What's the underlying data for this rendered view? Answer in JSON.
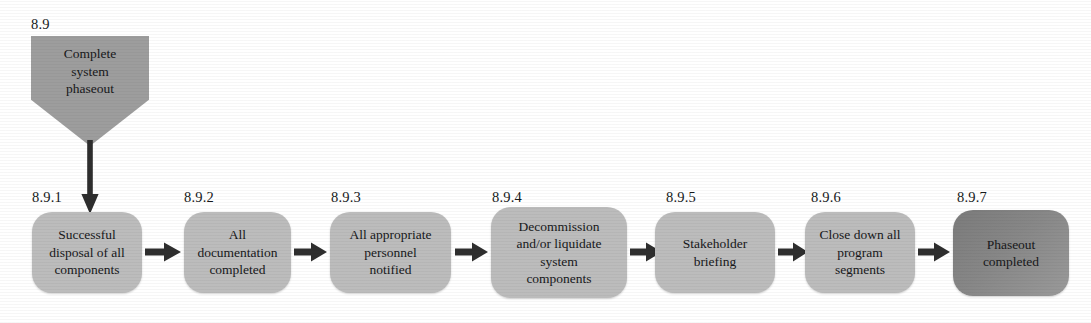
{
  "diagram": {
    "colors": {
      "start_node_fill": "#9d9d9d",
      "process_node_fill": "#bcbcbc",
      "final_node_fill": "#7f7f7f",
      "arrow": "#2e2e2e",
      "text": "#17181a",
      "background": "#ffffff"
    },
    "start_node": {
      "id": "8.9",
      "text": "Complete system phaseout",
      "lines": [
        "Complete",
        "system",
        "phaseout"
      ],
      "shape": "pentagon"
    },
    "steps": [
      {
        "id": "8.9.1",
        "text": "Successful disposal of all components",
        "lines": [
          "Successful",
          "disposal of all",
          "components"
        ],
        "shape": "rounded-rectangle",
        "shade": "light"
      },
      {
        "id": "8.9.2",
        "text": "All documentation completed",
        "lines": [
          "All",
          "documentation",
          "completed"
        ],
        "shape": "rounded-rectangle",
        "shade": "light"
      },
      {
        "id": "8.9.3",
        "text": "All appropriate personnel notified",
        "lines": [
          "All appropriate",
          "personnel",
          "notified"
        ],
        "shape": "rounded-rectangle",
        "shade": "light"
      },
      {
        "id": "8.9.4",
        "text": "Decommission and/or liquidate system components",
        "lines": [
          "Decommission",
          "and/or liquidate",
          "system",
          "components"
        ],
        "shape": "rounded-rectangle",
        "shade": "light"
      },
      {
        "id": "8.9.5",
        "text": "Stakeholder briefing",
        "lines": [
          "Stakeholder",
          "briefing"
        ],
        "shape": "rounded-rectangle",
        "shade": "light"
      },
      {
        "id": "8.9.6",
        "text": "Close down all program segments",
        "lines": [
          "Close down all",
          "program",
          "segments"
        ],
        "shape": "rounded-rectangle",
        "shade": "light"
      },
      {
        "id": "8.9.7",
        "text": "Phaseout completed",
        "lines": [
          "Phaseout",
          "completed"
        ],
        "shape": "rounded-rectangle",
        "shade": "dark"
      }
    ],
    "connectors": [
      {
        "name": "start-to-step1",
        "from": "8.9",
        "to": "8.9.1",
        "direction": "down"
      },
      {
        "name": "step1-to-step2",
        "from": "8.9.1",
        "to": "8.9.2",
        "direction": "right"
      },
      {
        "name": "step2-to-step3",
        "from": "8.9.2",
        "to": "8.9.3",
        "direction": "right"
      },
      {
        "name": "step3-to-step4",
        "from": "8.9.3",
        "to": "8.9.4",
        "direction": "right"
      },
      {
        "name": "step4-to-step5",
        "from": "8.9.4",
        "to": "8.9.5",
        "direction": "right"
      },
      {
        "name": "step5-to-step6",
        "from": "8.9.5",
        "to": "8.9.6",
        "direction": "right"
      },
      {
        "name": "step6-to-step7",
        "from": "8.9.6",
        "to": "8.9.7",
        "direction": "right"
      }
    ]
  }
}
